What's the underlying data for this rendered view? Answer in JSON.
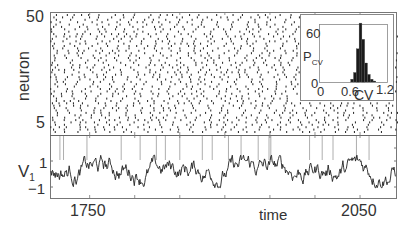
{
  "chart_data": [
    {
      "type": "scatter",
      "subtype": "raster",
      "title": "",
      "xlabel": "time",
      "ylabel": "neuron",
      "xlim": [
        1706,
        2091
      ],
      "ylim": [
        1,
        50
      ],
      "y_ticks": [
        "5",
        "50"
      ],
      "x_ticks": [
        "1750",
        "2050"
      ],
      "description": "Spike raster of 50 neurons; irregular asynchronous firing",
      "grid": false
    },
    {
      "type": "line",
      "title": "",
      "xlabel": "time",
      "ylabel": "V1",
      "xlim": [
        1706,
        2091
      ],
      "ylim": [
        -1.5,
        3.3
      ],
      "y_ticks": [
        "1",
        "-1"
      ],
      "x_ticks": [
        "1750",
        "2050"
      ],
      "spike_times": [
        1717,
        1721,
        1747,
        1785,
        1806,
        1824,
        1834,
        1850,
        1875,
        1886,
        1904,
        1918,
        1937,
        1949,
        1951,
        1994,
        2008,
        2020,
        2046,
        2060
      ],
      "description": "Membrane potential of neuron 1 fluctuating between about -1 and 1 with vertical spike lines",
      "grid": false
    },
    {
      "type": "bar",
      "subtype": "histogram",
      "title": "",
      "xlabel": "CV",
      "ylabel": "P_CV",
      "xlim": [
        0,
        1.2
      ],
      "ylim": [
        0,
        60
      ],
      "x_ticks": [
        "0",
        "0.6",
        "1.2"
      ],
      "y_ticks": [
        "0",
        "60"
      ],
      "categories": [
        0.55,
        0.6,
        0.65,
        0.7,
        0.75,
        0.8,
        0.85,
        0.9,
        0.95
      ],
      "values": [
        3,
        10,
        35,
        62,
        45,
        20,
        8,
        3,
        1
      ],
      "position": "inset, upper right"
    }
  ],
  "labels": {
    "neuron": "neuron",
    "v1_main": "V",
    "v1_sub": "1",
    "time": "time",
    "tick_50": "50",
    "tick_5": "5",
    "tick_v_pos": "1",
    "tick_v_neg": "−1",
    "tick_1750": "1750",
    "tick_2050": "2050",
    "inset_p": "P",
    "inset_p_sub": "CV",
    "inset_cv": "CV",
    "inset_0y": "0",
    "inset_60": "60",
    "inset_0x": "0",
    "inset_06": "0.6",
    "inset_12": "1.2"
  }
}
